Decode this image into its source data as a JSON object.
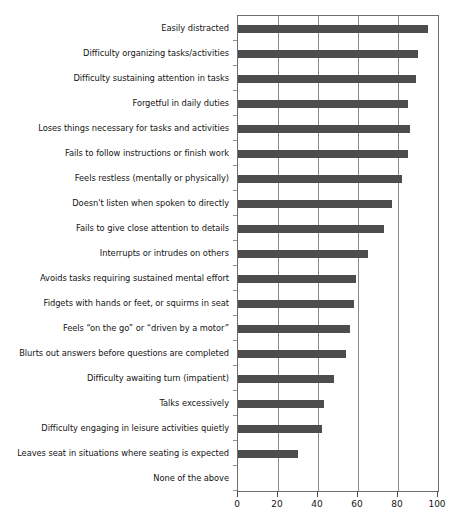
{
  "chart_data": {
    "type": "bar",
    "orientation": "horizontal",
    "title": "",
    "subtitle": "",
    "xlabel": "",
    "ylabel": "",
    "xlim": [
      0,
      100
    ],
    "xticks": [
      0,
      20,
      40,
      60,
      80,
      100
    ],
    "xtick_labels": [
      "0",
      "20",
      "40",
      "60",
      "80",
      "100"
    ],
    "grid": "vertical",
    "legend": "none",
    "bar_color": "#4d4d4d",
    "categories": [
      "Easily distracted",
      "Difficulty organizing tasks/activities",
      "Difficulty sustaining attention in tasks",
      "Forgetful in daily duties",
      "Loses things necessary for tasks and activities",
      "Fails to follow instructions or finish work",
      "Feels restless (mentally or physically)",
      "Doesn't listen when spoken to directly",
      "Fails to give close attention to details",
      "Interrupts or intrudes on others",
      "Avoids tasks requiring sustained mental effort",
      "Fidgets with hands or feet, or squirms in seat",
      "Feels “on the go” or “driven by a motor”",
      "Blurts out answers before questions are completed",
      "Difficulty awaiting turn (impatient)",
      "Talks excessively",
      "Difficulty engaging in leisure activities quietly",
      "Leaves seat in situations where seating is expected",
      "None of the above"
    ],
    "values": [
      95,
      90,
      89,
      85,
      86,
      85,
      82,
      77,
      73,
      65,
      59,
      58,
      56,
      54,
      48,
      43,
      42,
      30,
      0
    ]
  }
}
